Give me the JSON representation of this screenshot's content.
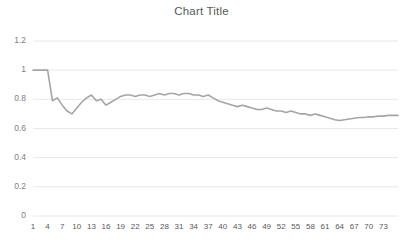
{
  "chart_data": {
    "type": "line",
    "title": "Chart Title",
    "xlabel": "",
    "ylabel": "",
    "grid": true,
    "legend": false,
    "legend_position": "none",
    "line_color": "#a5a5a5",
    "gridline_color": "#e8e8e8",
    "title_color": "#595959",
    "tick_label_color": "#7f7f7f",
    "ylim": [
      0,
      1.2
    ],
    "yticks": [
      0,
      0.2,
      0.4,
      0.6,
      0.8,
      1,
      1.2
    ],
    "ytick_labels": [
      "0",
      "0.2",
      "0.4",
      "0.6",
      "0.8",
      "1",
      "1.2"
    ],
    "xlim": [
      1,
      76
    ],
    "xticks": [
      1,
      4,
      7,
      10,
      13,
      16,
      19,
      22,
      25,
      28,
      31,
      34,
      37,
      40,
      43,
      46,
      49,
      52,
      55,
      58,
      61,
      64,
      67,
      70,
      73
    ],
    "xtick_labels": [
      "1",
      "4",
      "7",
      "10",
      "13",
      "16",
      "19",
      "22",
      "25",
      "28",
      "31",
      "34",
      "37",
      "40",
      "43",
      "46",
      "49",
      "52",
      "55",
      "58",
      "61",
      "64",
      "67",
      "70",
      "73"
    ],
    "x": [
      1,
      2,
      3,
      4,
      5,
      6,
      7,
      8,
      9,
      10,
      11,
      12,
      13,
      14,
      15,
      16,
      17,
      18,
      19,
      20,
      21,
      22,
      23,
      24,
      25,
      26,
      27,
      28,
      29,
      30,
      31,
      32,
      33,
      34,
      35,
      36,
      37,
      38,
      39,
      40,
      41,
      42,
      43,
      44,
      45,
      46,
      47,
      48,
      49,
      50,
      51,
      52,
      53,
      54,
      55,
      56,
      57,
      58,
      59,
      60,
      61,
      62,
      63,
      64,
      65,
      66,
      67,
      68,
      69,
      70,
      71,
      72,
      73,
      74,
      75,
      76
    ],
    "values": [
      1.0,
      1.0,
      1.0,
      1.0,
      0.79,
      0.81,
      0.76,
      0.72,
      0.7,
      0.74,
      0.78,
      0.81,
      0.83,
      0.79,
      0.8,
      0.76,
      0.78,
      0.8,
      0.82,
      0.83,
      0.83,
      0.82,
      0.83,
      0.83,
      0.82,
      0.83,
      0.84,
      0.83,
      0.84,
      0.84,
      0.83,
      0.84,
      0.84,
      0.83,
      0.83,
      0.82,
      0.83,
      0.81,
      0.79,
      0.78,
      0.77,
      0.76,
      0.75,
      0.76,
      0.75,
      0.74,
      0.73,
      0.73,
      0.74,
      0.73,
      0.72,
      0.72,
      0.71,
      0.72,
      0.71,
      0.7,
      0.7,
      0.69,
      0.7,
      0.69,
      0.68,
      0.67,
      0.66,
      0.655,
      0.66,
      0.665,
      0.67,
      0.675,
      0.675,
      0.68,
      0.68,
      0.685,
      0.685,
      0.69,
      0.69,
      0.69
    ],
    "series": [
      {
        "name": "Series 1",
        "color": "#a5a5a5"
      }
    ]
  }
}
